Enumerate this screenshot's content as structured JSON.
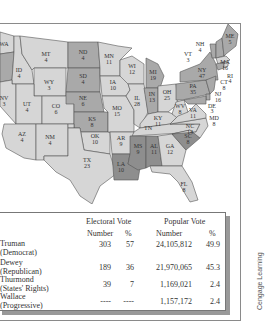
{
  "colors": {
    "truman": "#d6d6d6",
    "dewey": "#a9a9a9",
    "thurmond": "#8e8e8e",
    "border": "#555555",
    "background": "#ffffff"
  },
  "map": {
    "states": [
      {
        "abbr": "WA",
        "votes": "8",
        "party": "truman"
      },
      {
        "abbr": "OR",
        "votes": "6",
        "party": "dewey"
      },
      {
        "abbr": "ID",
        "votes": "4",
        "party": "truman"
      },
      {
        "abbr": "MT",
        "votes": "4",
        "party": "truman"
      },
      {
        "abbr": "WY",
        "votes": "3",
        "party": "truman"
      },
      {
        "abbr": "NV",
        "votes": "3",
        "party": "truman"
      },
      {
        "abbr": "UT",
        "votes": "4",
        "party": "truman"
      },
      {
        "abbr": "CO",
        "votes": "6",
        "party": "truman"
      },
      {
        "abbr": "AZ",
        "votes": "4",
        "party": "truman"
      },
      {
        "abbr": "NM",
        "votes": "4",
        "party": "truman"
      },
      {
        "abbr": "ND",
        "votes": "4",
        "party": "dewey"
      },
      {
        "abbr": "SD",
        "votes": "4",
        "party": "dewey"
      },
      {
        "abbr": "NE",
        "votes": "6",
        "party": "dewey"
      },
      {
        "abbr": "KS",
        "votes": "8",
        "party": "dewey"
      },
      {
        "abbr": "OK",
        "votes": "10",
        "party": "truman"
      },
      {
        "abbr": "TX",
        "votes": "23",
        "party": "truman"
      },
      {
        "abbr": "MN",
        "votes": "11",
        "party": "truman"
      },
      {
        "abbr": "IA",
        "votes": "10",
        "party": "truman"
      },
      {
        "abbr": "MO",
        "votes": "15",
        "party": "truman"
      },
      {
        "abbr": "AR",
        "votes": "9",
        "party": "truman"
      },
      {
        "abbr": "LA",
        "votes": "10",
        "party": "thurmond"
      },
      {
        "abbr": "WI",
        "votes": "12",
        "party": "truman"
      },
      {
        "abbr": "IL",
        "votes": "28",
        "party": "truman"
      },
      {
        "abbr": "MS",
        "votes": "9",
        "party": "thurmond"
      },
      {
        "abbr": "MI",
        "votes": "19",
        "party": "dewey"
      },
      {
        "abbr": "IN",
        "votes": "13",
        "party": "dewey"
      },
      {
        "abbr": "KY",
        "votes": "11",
        "party": "truman"
      },
      {
        "abbr": "TN",
        "votes": "12",
        "party": "truman"
      },
      {
        "abbr": "AL",
        "votes": "11",
        "party": "thurmond"
      },
      {
        "abbr": "OH",
        "votes": "25",
        "party": "truman"
      },
      {
        "abbr": "WV",
        "votes": "8",
        "party": "truman"
      },
      {
        "abbr": "VA",
        "votes": "11",
        "party": "truman"
      },
      {
        "abbr": "NC",
        "votes": "14",
        "party": "truman"
      },
      {
        "abbr": "SC",
        "votes": "8",
        "party": "thurmond"
      },
      {
        "abbr": "GA",
        "votes": "12",
        "party": "truman"
      },
      {
        "abbr": "FL",
        "votes": "8",
        "party": "truman"
      },
      {
        "abbr": "PA",
        "votes": "35",
        "party": "dewey"
      },
      {
        "abbr": "NY",
        "votes": "47",
        "party": "dewey"
      },
      {
        "abbr": "VT",
        "votes": "3",
        "party": "dewey"
      },
      {
        "abbr": "NH",
        "votes": "4",
        "party": "dewey"
      },
      {
        "abbr": "ME",
        "votes": "5",
        "party": "dewey"
      },
      {
        "abbr": "MA",
        "votes": "16",
        "party": "truman"
      },
      {
        "abbr": "RI",
        "votes": "4",
        "party": "truman"
      },
      {
        "abbr": "CT",
        "votes": "8",
        "party": "dewey"
      },
      {
        "abbr": "NJ",
        "votes": "16",
        "party": "dewey"
      },
      {
        "abbr": "DE",
        "votes": "3",
        "party": "dewey"
      },
      {
        "abbr": "MD",
        "votes": "8",
        "party": "dewey"
      }
    ]
  },
  "table": {
    "group_headers": {
      "electoral": "Electoral Vote",
      "popular": "Popular Vote"
    },
    "sub_headers": {
      "ev_number": "Number",
      "ev_pct": "%",
      "pv_number": "Number",
      "pv_pct": "%"
    },
    "rows": [
      {
        "name": "Truman",
        "party": "(Democrat)",
        "ev_number": "303",
        "ev_pct": "57",
        "pv_number": "24,105,812",
        "pv_pct": "49.9"
      },
      {
        "name": "Dewey",
        "party": "(Republican)",
        "ev_number": "189",
        "ev_pct": "36",
        "pv_number": "21,970,065",
        "pv_pct": "45.3"
      },
      {
        "name": "Thurmond",
        "party": "(States' Rights)",
        "ev_number": "39",
        "ev_pct": "7",
        "pv_number": "1,169,021",
        "pv_pct": "2.4"
      },
      {
        "name": "Wallace",
        "party": "(Progressive)",
        "ev_number": "----",
        "ev_pct": "----",
        "pv_number": "1,157,172",
        "pv_pct": "2.4"
      }
    ]
  },
  "credit": "Cengage Learning"
}
